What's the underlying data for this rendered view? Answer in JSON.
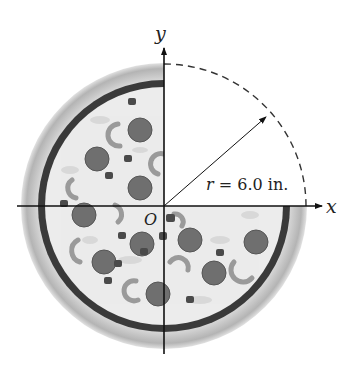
{
  "figure": {
    "axes": {
      "x_label": "x",
      "y_label": "y",
      "origin_label": "O"
    },
    "radius_label": {
      "var": "r",
      "text": " = 6.0 in."
    },
    "pizza": {
      "description": "pizza with pepperoni, peppers and olives; right-upper quadrant cut away",
      "missing_quadrant": "first",
      "toppings": {
        "pepperoni_count": 12
      }
    },
    "colors": {
      "crust_outer": "#bdbdbd",
      "crust_dark": "#3a3a3a",
      "cheese": "#ececec",
      "pepperoni": "#6f6f6f",
      "pepper": "#9a9a9a",
      "olive": "#4a4a4a",
      "axis": "#111111"
    }
  }
}
